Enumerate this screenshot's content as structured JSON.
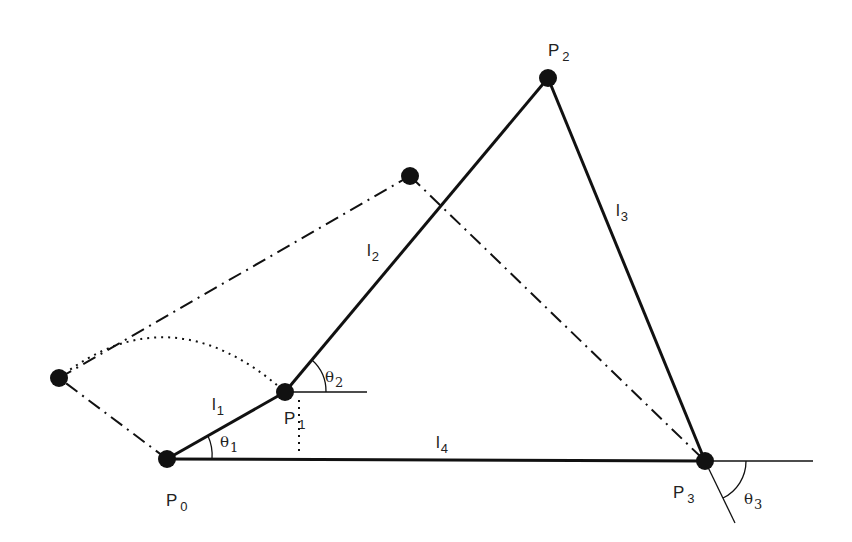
{
  "diagram": {
    "colors": {
      "ink": "#111111",
      "text": "#222222",
      "background": "#ffffff"
    },
    "points": {
      "P0": {
        "label": "P",
        "sub": "0",
        "x": 167,
        "y": 459
      },
      "P1": {
        "label": "P",
        "sub": "1",
        "x": 285,
        "y": 392
      },
      "P2": {
        "label": "P",
        "sub": "2",
        "x": 548,
        "y": 78
      },
      "P3": {
        "label": "P",
        "sub": "3",
        "x": 705,
        "y": 461
      },
      "P1_alt": {
        "x": 59,
        "y": 378
      },
      "P2_alt": {
        "x": 410,
        "y": 176
      }
    },
    "links": {
      "l1": {
        "label": "l",
        "sub": "1",
        "from": "P0",
        "to": "P1"
      },
      "l2": {
        "label": "l",
        "sub": "2",
        "from": "P1",
        "to": "P2"
      },
      "l3": {
        "label": "l",
        "sub": "3",
        "from": "P2",
        "to": "P3"
      },
      "l4": {
        "label": "l",
        "sub": "4",
        "from": "P0",
        "to": "P3"
      }
    },
    "angles": {
      "theta1": {
        "label": "θ",
        "sub": "1"
      },
      "theta2": {
        "label": "θ",
        "sub": "2"
      },
      "theta3": {
        "label": "θ",
        "sub": "3"
      }
    },
    "line_styles": {
      "current_configuration": "solid",
      "alternate_configuration": "dash-dot",
      "swing_arc": "dotted"
    }
  }
}
